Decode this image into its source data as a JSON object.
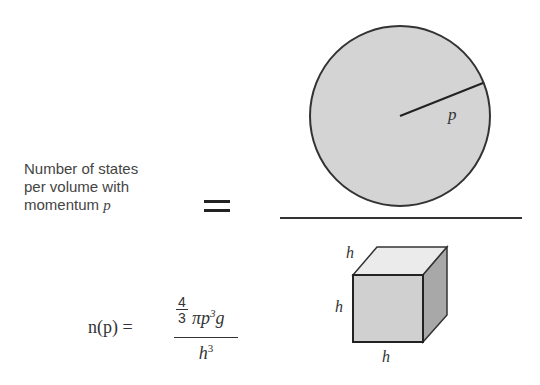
{
  "label": {
    "line1": "Number of states",
    "line2": "per volume with",
    "line3": "momentum",
    "var": "p"
  },
  "sphere": {
    "radius_label": "p",
    "fill": "#d4d4d4",
    "stroke": "#333333"
  },
  "cube": {
    "top_label": "h",
    "side_label": "h",
    "bottom_label": "h",
    "front_fill": "#d0d0d0",
    "top_fill": "#ebebeb",
    "side_fill": "#a8a8a8"
  },
  "formula": {
    "lhs": "n(p) =",
    "num_frac_top": "4",
    "num_frac_bottom": "3",
    "num_rest": "πp",
    "num_exp": "3",
    "num_tail": "g",
    "den": "h",
    "den_exp": "3"
  }
}
